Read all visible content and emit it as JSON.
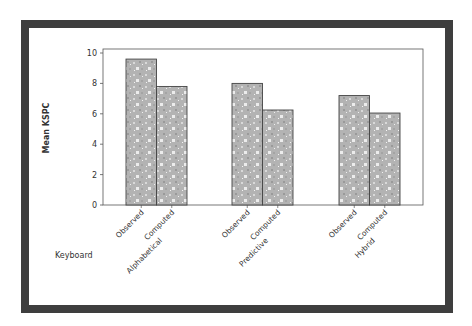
{
  "chart_data": {
    "type": "bar",
    "title": "",
    "xlabel": "Keyboard",
    "ylabel": "Mean KSPC",
    "ylim": [
      0,
      10
    ],
    "yticks": [
      0,
      2,
      4,
      6,
      8,
      10
    ],
    "ytick_labels": [
      "0",
      "2",
      "4",
      "6",
      "8",
      "10"
    ],
    "grid": false,
    "legend": null,
    "groups": [
      "Alphabetical",
      "Predictive",
      "Hybrid"
    ],
    "sub_categories": [
      "Observed",
      "Computed"
    ],
    "series": [
      {
        "name": "Observed",
        "values": [
          9.6,
          8.0,
          7.2
        ]
      },
      {
        "name": "Computed",
        "values": [
          7.8,
          6.25,
          6.05
        ]
      }
    ],
    "bar_fill": "#b5b5b5",
    "bar_pattern": "speckled gray"
  },
  "labels": {
    "y_axis_title": "Mean KSPC",
    "x_axis_title": "Keyboard",
    "bar_labels": [
      "Observed",
      "Computed",
      "Observed",
      "Computed",
      "Observed",
      "Computed"
    ],
    "group_labels": [
      "Alphabetical",
      "Predictive",
      "Hybrid"
    ],
    "ytick_labels": [
      "0",
      "2",
      "4",
      "6",
      "8",
      "10"
    ]
  }
}
